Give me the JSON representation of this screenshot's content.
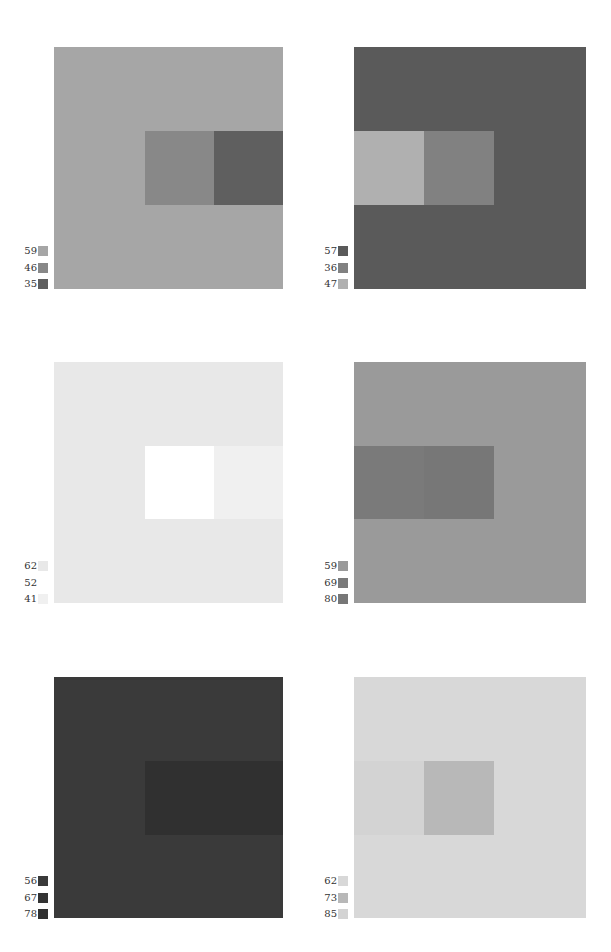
{
  "panels": [
    {
      "id": "top-left",
      "square": {
        "x": 54,
        "y": 47,
        "w": 229,
        "h": 242
      },
      "background": "#a6a6a6",
      "inner": {
        "x": 145,
        "y": 131,
        "w": 138,
        "h": 74
      },
      "inner_blocks": [
        "#888888",
        "#5f5f5f"
      ],
      "legend": {
        "x": 0,
        "y": 246,
        "items": [
          {
            "label": "59",
            "color": "#a6a6a6"
          },
          {
            "label": "46",
            "color": "#888888"
          },
          {
            "label": "35",
            "color": "#5f5f5f"
          }
        ]
      }
    },
    {
      "id": "top-right",
      "square": {
        "x": 354,
        "y": 47,
        "w": 232,
        "h": 242
      },
      "background": "#5a5a5a",
      "inner": {
        "x": 354,
        "y": 131,
        "w": 140,
        "h": 74
      },
      "inner_blocks": [
        "#b0b0b0",
        "#818181"
      ],
      "legend": {
        "x": 300,
        "y": 246,
        "items": [
          {
            "label": "57",
            "color": "#5a5a5a"
          },
          {
            "label": "36",
            "color": "#818181"
          },
          {
            "label": "47",
            "color": "#b0b0b0"
          }
        ]
      }
    },
    {
      "id": "middle-left",
      "square": {
        "x": 54,
        "y": 362,
        "w": 229,
        "h": 241
      },
      "background": "#e8e8e8",
      "inner": {
        "x": 145,
        "y": 446,
        "w": 138,
        "h": 73
      },
      "inner_blocks": [
        "#ffffff",
        "#f0f0f0"
      ],
      "legend": {
        "x": 0,
        "y": 561,
        "items": [
          {
            "label": "62",
            "color": "#e8e8e8"
          },
          {
            "label": "52",
            "color": "#ffffff"
          },
          {
            "label": "41",
            "color": "#f0f0f0"
          }
        ]
      }
    },
    {
      "id": "middle-right",
      "square": {
        "x": 354,
        "y": 362,
        "w": 232,
        "h": 241
      },
      "background": "#9a9a9a",
      "inner": {
        "x": 354,
        "y": 446,
        "w": 140,
        "h": 73
      },
      "inner_blocks": [
        "#7a7a7a",
        "#777777"
      ],
      "legend": {
        "x": 300,
        "y": 561,
        "items": [
          {
            "label": "59",
            "color": "#9a9a9a"
          },
          {
            "label": "69",
            "color": "#7a7a7a"
          },
          {
            "label": "80",
            "color": "#777777"
          }
        ]
      }
    },
    {
      "id": "bottom-left",
      "square": {
        "x": 54,
        "y": 677,
        "w": 229,
        "h": 241
      },
      "background": "#3a3a3a",
      "inner": {
        "x": 145,
        "y": 761,
        "w": 138,
        "h": 74
      },
      "inner_blocks": [
        "#303030",
        "#303030"
      ],
      "legend": {
        "x": 0,
        "y": 876,
        "items": [
          {
            "label": "56",
            "color": "#3a3a3a"
          },
          {
            "label": "67",
            "color": "#333333"
          },
          {
            "label": "78",
            "color": "#303030"
          }
        ]
      }
    },
    {
      "id": "bottom-right",
      "square": {
        "x": 354,
        "y": 677,
        "w": 232,
        "h": 241
      },
      "background": "#d8d8d8",
      "inner": {
        "x": 354,
        "y": 761,
        "w": 140,
        "h": 74
      },
      "inner_blocks": [
        "#d3d3d3",
        "#b8b8b8"
      ],
      "legend": {
        "x": 300,
        "y": 876,
        "items": [
          {
            "label": "62",
            "color": "#d8d8d8"
          },
          {
            "label": "73",
            "color": "#b8b8b8"
          },
          {
            "label": "85",
            "color": "#d3d3d3"
          }
        ]
      }
    }
  ]
}
